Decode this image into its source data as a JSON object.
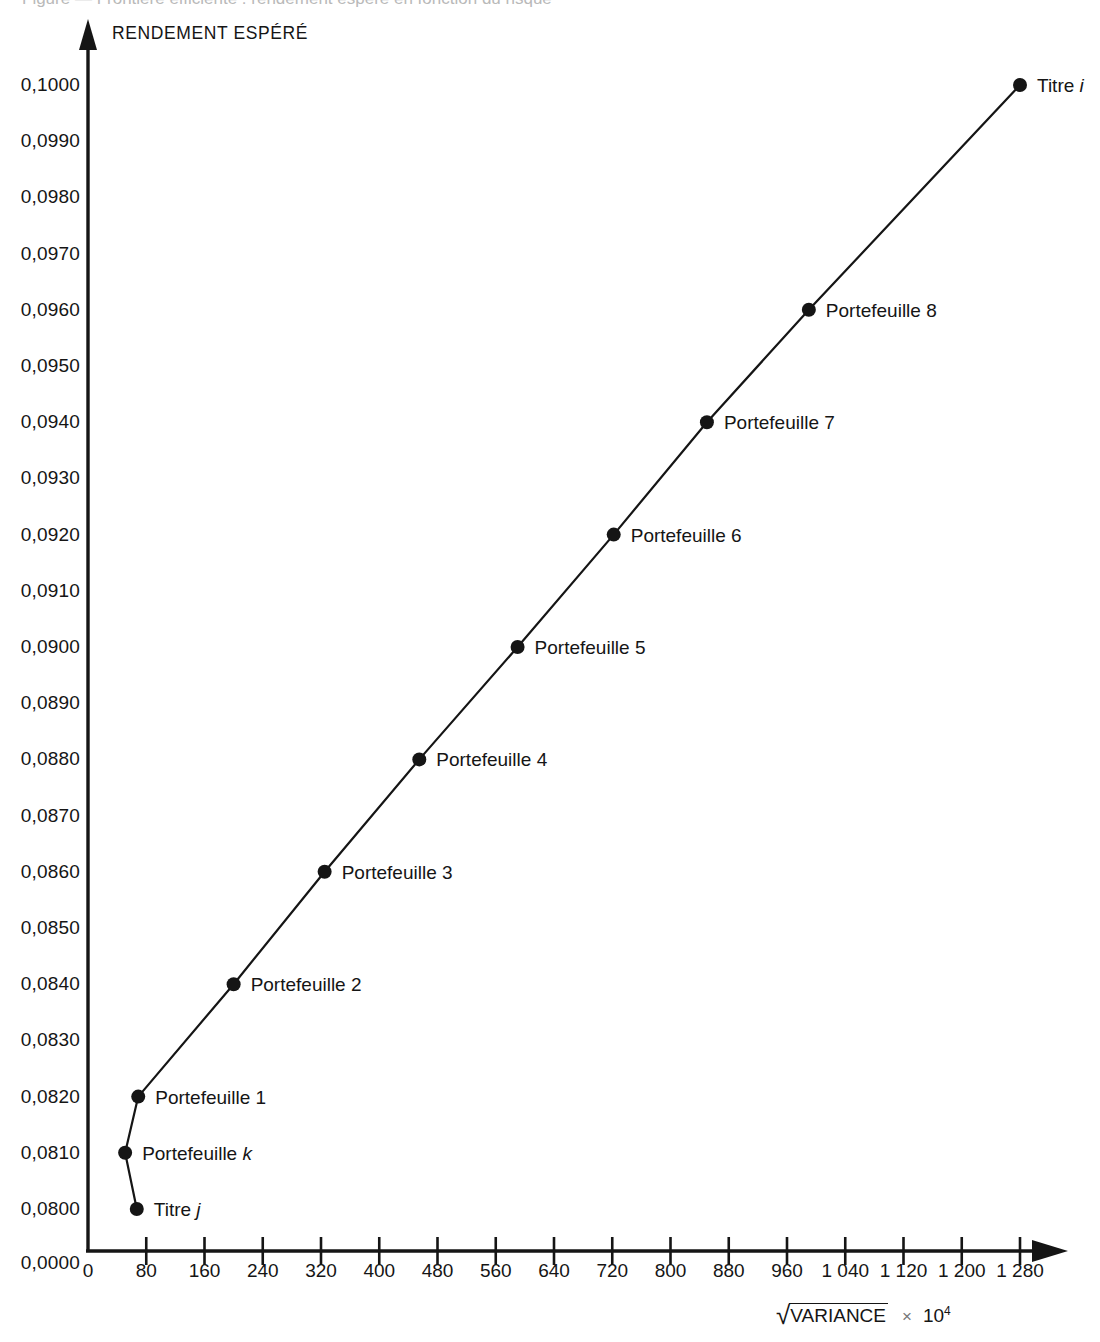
{
  "figure": {
    "cut_off_caption": "Figure — Frontière efficiente : rendement espéré en fonction du risque",
    "y_axis_title": "RENDEMENT ESPÉRÉ",
    "x_axis_title_radical": "√",
    "x_axis_title_radicand": "VARIANCE",
    "x_axis_title_times": "×",
    "x_axis_title_power_base": "10",
    "x_axis_title_power_exp": "4"
  },
  "chart_data": {
    "type": "line",
    "title": "",
    "xlabel": "√VARIANCE × 10⁴",
    "ylabel": "RENDEMENT ESPÉRÉ",
    "xlim": [
      0,
      1330
    ],
    "ylim": [
      0.0795,
      0.1005
    ],
    "grid": false,
    "legend": "none",
    "y_tick_labels": [
      "0,1000",
      "0,0990",
      "0,0980",
      "0,0970",
      "0,0960",
      "0,0950",
      "0,0940",
      "0,0930",
      "0,0920",
      "0,0910",
      "0,0900",
      "0,0890",
      "0,0880",
      "0,0870",
      "0,0860",
      "0,0850",
      "0,0840",
      "0,0830",
      "0,0820",
      "0,0810",
      "0,0800",
      "0,0000"
    ],
    "y_tick_values": [
      0.1,
      0.099,
      0.098,
      0.097,
      0.096,
      0.095,
      0.094,
      0.093,
      0.092,
      0.091,
      0.09,
      0.089,
      0.088,
      0.087,
      0.086,
      0.085,
      0.084,
      0.083,
      0.082,
      0.081,
      0.08,
      0.0
    ],
    "x_tick_labels": [
      "0",
      "80",
      "160",
      "240",
      "320",
      "400",
      "480",
      "560",
      "640",
      "720",
      "800",
      "880",
      "960",
      "1 040",
      "1 120",
      "1 200",
      "1 280"
    ],
    "x_tick_values": [
      0,
      80,
      160,
      240,
      320,
      400,
      480,
      560,
      640,
      720,
      800,
      880,
      960,
      1040,
      1120,
      1200,
      1280
    ],
    "points": [
      {
        "label": "Titre j",
        "label_italic_tail": "j",
        "x": 67,
        "y": 0.08
      },
      {
        "label": "Portefeuille k",
        "label_italic_tail": "k",
        "x": 51,
        "y": 0.081
      },
      {
        "label": "Portefeuille 1",
        "label_italic_tail": "",
        "x": 69,
        "y": 0.082
      },
      {
        "label": "Portefeuille 2",
        "label_italic_tail": "",
        "x": 200,
        "y": 0.084
      },
      {
        "label": "Portefeuille 3",
        "label_italic_tail": "",
        "x": 325,
        "y": 0.086
      },
      {
        "label": "Portefeuille 4",
        "label_italic_tail": "",
        "x": 455,
        "y": 0.088
      },
      {
        "label": "Portefeuille 5",
        "label_italic_tail": "",
        "x": 590,
        "y": 0.09
      },
      {
        "label": "Portefeuille 6",
        "label_italic_tail": "",
        "x": 722,
        "y": 0.092
      },
      {
        "label": "Portefeuille 7",
        "label_italic_tail": "",
        "x": 850,
        "y": 0.094
      },
      {
        "label": "Portefeuille 8",
        "label_italic_tail": "",
        "x": 990,
        "y": 0.096
      },
      {
        "label": "Titre i",
        "label_italic_tail": "i",
        "x": 1280,
        "y": 0.1
      }
    ],
    "series": [
      {
        "name": "Frontière efficiente",
        "order": [
          "Titre j",
          "Portefeuille k",
          "Portefeuille 1",
          "Portefeuille 2",
          "Portefeuille 3",
          "Portefeuille 4",
          "Portefeuille 5",
          "Portefeuille 6",
          "Portefeuille 7",
          "Portefeuille 8",
          "Titre i"
        ],
        "x": [
          67,
          51,
          69,
          200,
          325,
          455,
          590,
          722,
          850,
          990,
          1280
        ],
        "values": [
          0.08,
          0.081,
          0.082,
          0.084,
          0.086,
          0.088,
          0.09,
          0.092,
          0.094,
          0.096,
          0.1
        ]
      }
    ]
  },
  "style": {
    "ink": "#151515",
    "paper": "#ffffff",
    "marker_radius": 7
  }
}
